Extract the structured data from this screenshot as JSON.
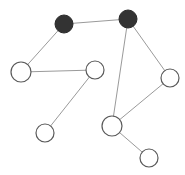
{
  "diagram": {
    "type": "graph",
    "width": 185,
    "height": 175,
    "colors": {
      "background": "#ffffff",
      "edge": "#9a9a9a",
      "node_filled": "#333333",
      "node_open_stroke": "#5a5a5a",
      "node_open_fill": "#ffffff"
    },
    "nodes": [
      {
        "id": "A",
        "x": 64,
        "y": 24,
        "r": 9,
        "filled": true
      },
      {
        "id": "B",
        "x": 128,
        "y": 19,
        "r": 9,
        "filled": true
      },
      {
        "id": "C",
        "x": 21,
        "y": 72,
        "r": 10,
        "filled": false
      },
      {
        "id": "D",
        "x": 95,
        "y": 70,
        "r": 9,
        "filled": false
      },
      {
        "id": "E",
        "x": 170,
        "y": 78,
        "r": 9,
        "filled": false
      },
      {
        "id": "F",
        "x": 112,
        "y": 126,
        "r": 10,
        "filled": false
      },
      {
        "id": "G",
        "x": 45,
        "y": 133,
        "r": 9,
        "filled": false
      },
      {
        "id": "H",
        "x": 149,
        "y": 158,
        "r": 9,
        "filled": false
      }
    ],
    "edges": [
      {
        "from": "A",
        "to": "B"
      },
      {
        "from": "A",
        "to": "C"
      },
      {
        "from": "C",
        "to": "D"
      },
      {
        "from": "D",
        "to": "G"
      },
      {
        "from": "B",
        "to": "F"
      },
      {
        "from": "B",
        "to": "E"
      },
      {
        "from": "E",
        "to": "F"
      },
      {
        "from": "F",
        "to": "H"
      }
    ]
  }
}
